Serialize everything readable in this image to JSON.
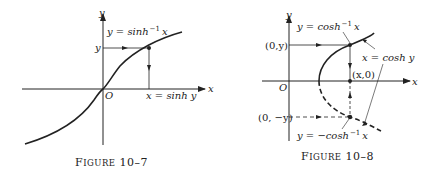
{
  "figures": [
    {
      "id": "fig-10-7",
      "caption_prefix": "F",
      "caption_small": "IGURE",
      "caption_num": "10–7",
      "axis_x_label": "x",
      "axis_y_label": "y",
      "origin_label": "O",
      "curve_label_lhs": "y = sinh",
      "curve_label_sup": "−1",
      "curve_label_rhs": "x",
      "y_marker_label": "y",
      "x_marker_label": "x = sinh y"
    },
    {
      "id": "fig-10-8",
      "caption_prefix": "F",
      "caption_small": "IGURE",
      "caption_num": "10–8",
      "axis_x_label": "x",
      "axis_y_label": "y",
      "origin_label": "O",
      "upper_label_lhs": "y = cosh",
      "upper_label_sup": "−1",
      "upper_label_rhs": "x",
      "lower_label_lhs": "y = −cosh",
      "lower_label_sup": "−1",
      "lower_label_rhs": "x",
      "curve_label": "x = cosh y",
      "point_top_label": "(0,y)",
      "point_axis_label": "(x,0)",
      "point_bottom_label": "(0, −y)"
    }
  ],
  "colors": {
    "ink": "#222222",
    "background": "#ffffff"
  }
}
